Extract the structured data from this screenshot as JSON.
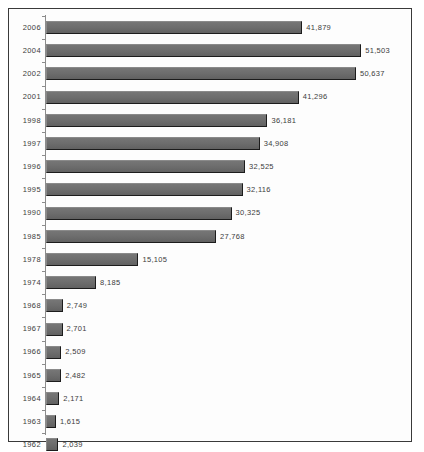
{
  "chart_data": {
    "type": "bar",
    "orientation": "horizontal",
    "title": "",
    "subtitle": "",
    "xlabel": "",
    "ylabel": "",
    "grid": false,
    "legend": false,
    "xlim": [
      0,
      58000
    ],
    "axis_line": true,
    "tick_marks": true,
    "value_labels": true,
    "bar_color": "#6e6e6e",
    "bar_edge_color": "#1c1c1c",
    "frame_color": "#3a3a3a",
    "background_color": "#fdfdfd",
    "text_color": "#3c3c3c",
    "categories": [
      "2006",
      "2004",
      "2002",
      "2001",
      "1998",
      "1997",
      "1996",
      "1995",
      "1990",
      "1985",
      "1978",
      "1974",
      "1968",
      "1967",
      "1966",
      "1965",
      "1964",
      "1963",
      "1962"
    ],
    "values": [
      41879,
      51503,
      50637,
      41296,
      36181,
      34908,
      32525,
      32116,
      30325,
      27768,
      15105,
      8185,
      2749,
      2701,
      2509,
      2482,
      2171,
      1615,
      2039
    ],
    "value_labels_text": [
      "41,879",
      "51,503",
      "50,637",
      "41,296",
      "36,181",
      "34,908",
      "32,525",
      "32,116",
      "30,325",
      "27,768",
      "15,105",
      "8,185",
      "2,749",
      "2,701",
      "2,509",
      "2,482",
      "2,171",
      "1,615",
      "2,039"
    ]
  }
}
